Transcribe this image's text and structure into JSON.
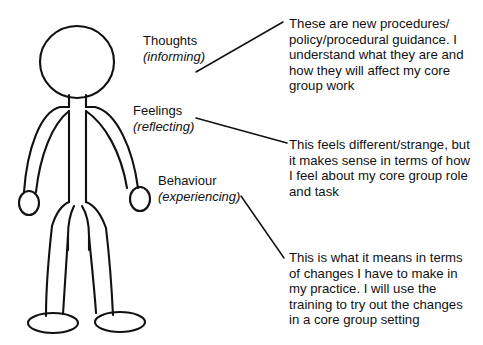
{
  "diagram": {
    "stroke_color": "#111111",
    "background_color": "#ffffff",
    "figure": {
      "name": "stick-person",
      "parts": [
        "head",
        "neck",
        "torso",
        "left-arm",
        "right-arm",
        "left-hand",
        "right-hand",
        "left-leg",
        "right-leg",
        "left-foot",
        "right-foot"
      ]
    }
  },
  "labels": [
    {
      "id": "thoughts",
      "title": "Thoughts",
      "subtitle": "(informing)"
    },
    {
      "id": "feelings",
      "title": "Feelings",
      "subtitle": "(reflecting)"
    },
    {
      "id": "behaviour",
      "title": "Behaviour",
      "subtitle": "(experiencing)"
    }
  ],
  "notes": [
    {
      "id": "thoughts",
      "lines": [
        "These are new procedures/",
        "policy/procedural guidance. I",
        "understand what they are and",
        "how they will affect my core",
        "group work"
      ]
    },
    {
      "id": "feelings",
      "lines": [
        "This feels different/strange, but",
        "it makes sense in terms of how",
        "I feel about my core group role",
        "and task"
      ]
    },
    {
      "id": "behaviour",
      "lines": [
        "This is what it means in terms",
        "of changes I have to make in",
        "my practice. I will use the",
        "training to try out the changes",
        "in a core group setting"
      ]
    }
  ],
  "connectors": [
    {
      "id": "thoughts-connector",
      "from": [
        196,
        72
      ],
      "to": [
        283,
        22
      ]
    },
    {
      "id": "feelings-connector",
      "from": [
        196,
        118
      ],
      "to": [
        287,
        143
      ]
    },
    {
      "id": "behaviour-connector",
      "from": [
        241,
        196
      ],
      "to": [
        284,
        258
      ]
    }
  ]
}
